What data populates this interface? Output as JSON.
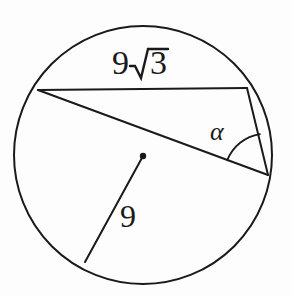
{
  "figure": {
    "type": "geometry-diagram",
    "background_color": "#fdfdfd",
    "stroke_color": "#1a1a1a"
  },
  "labels": {
    "chord_length": "9√3",
    "chord_coefficient": "9",
    "chord_radicand": "3",
    "radical_symbol": "√",
    "radius_length": "9",
    "angle_label": "α"
  },
  "geometry": {
    "circle": {
      "center_x": 143,
      "center_y": 155,
      "radius": 129
    },
    "center_dot": {
      "x": 143,
      "y": 156,
      "r": 3
    },
    "points": {
      "A_left": {
        "x": 38,
        "y": 90
      },
      "B_top_right": {
        "x": 247,
        "y": 88
      },
      "C_bottom_right": {
        "x": 268,
        "y": 175
      },
      "D_radius_end": {
        "x": 85,
        "y": 262
      }
    },
    "segments": [
      {
        "name": "chord-AB",
        "from": "A_left",
        "to": "B_top_right",
        "label": "9√3"
      },
      {
        "name": "chord-AC",
        "from": "A_left",
        "to": "C_bottom_right",
        "label": ""
      },
      {
        "name": "chord-BC",
        "from": "B_top_right",
        "to": "C_bottom_right",
        "label": ""
      },
      {
        "name": "radius-OD",
        "from": "center",
        "to": "D_radius_end",
        "label": "9"
      }
    ],
    "angle_arc": {
      "vertex": "C_bottom_right",
      "radius": 42,
      "label": "α"
    }
  }
}
